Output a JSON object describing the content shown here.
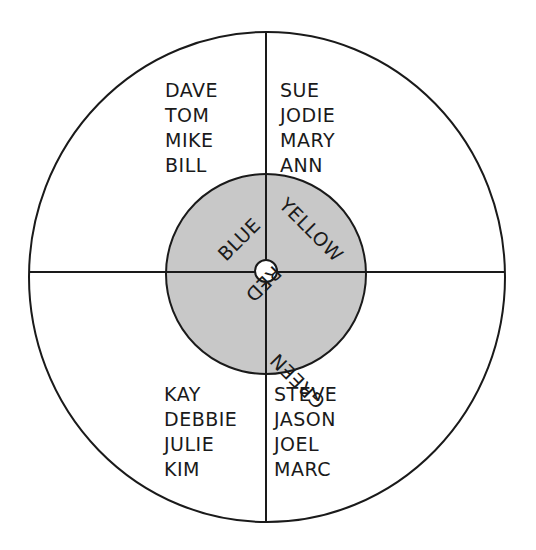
{
  "diagram": {
    "colors": {
      "line": "#1a1a1a",
      "inner_fill": "#c8c8c8",
      "background": "#ffffff"
    },
    "inner_labels": {
      "top_left": "BLUE",
      "top_right": "YELLOW",
      "bottom_left": "RED",
      "bottom_right": "GREEN"
    },
    "quadrants": {
      "top_left": [
        "DAVE",
        "TOM",
        "MIKE",
        "BILL"
      ],
      "top_right": [
        "SUE",
        "JODIE",
        "MARY",
        "ANN"
      ],
      "bottom_left": [
        "KAY",
        "DEBBIE",
        "JULIE",
        "KIM"
      ],
      "bottom_right": [
        "STEVE",
        "JASON",
        "JOEL",
        "MARC"
      ]
    }
  }
}
